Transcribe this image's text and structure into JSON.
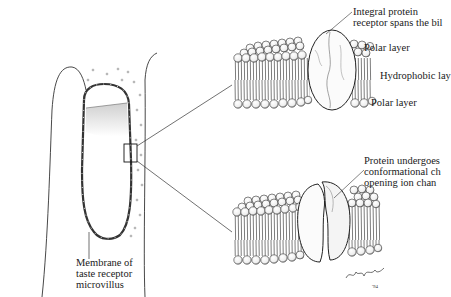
{
  "diagram": {
    "labels": {
      "integral_protein_line1": "Integral protein",
      "integral_protein_line2": "receptor spans the bil",
      "polar_layer_top": "Polar layer",
      "hydrophobic_layer": "Hydrophobic lay",
      "polar_layer_bottom": "Polar layer",
      "protein_change_line1": "Protein undergoes",
      "protein_change_line2": "conformational ch",
      "protein_change_line3": "opening ion chan",
      "membrane_line1": "Membrane of",
      "membrane_line2": "taste receptor",
      "membrane_line3": "microvillus"
    },
    "panels": [
      {
        "name": "microvillus-overview",
        "description": "Outline of taste receptor cell with microvillus, magnification box on membrane"
      },
      {
        "name": "bilayer-closed",
        "description": "Lipid bilayer with integral protein receptor (closed)"
      },
      {
        "name": "bilayer-open",
        "description": "Lipid bilayer with receptor protein split, opening ion channel"
      }
    ],
    "signature": "Robert Demarest"
  }
}
